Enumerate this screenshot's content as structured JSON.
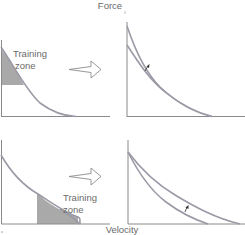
{
  "diagram": {
    "y_axis_label": "Force",
    "x_axis_label": "Velocity",
    "panels": [
      {
        "id": "top-left",
        "description": "Force-velocity curve with training zone at high force / low velocity",
        "zone_label_line1": "Training",
        "zone_label_line2": "zone",
        "zone_position": "high-force"
      },
      {
        "id": "top-right",
        "description": "Curve shifted upward at high-force end after heavy-load training",
        "shift_marker": "up-arrow"
      },
      {
        "id": "bottom-left",
        "description": "Force-velocity curve with training zone at low force / high velocity",
        "zone_label_line1": "Training",
        "zone_label_line2": "zone",
        "zone_position": "high-velocity"
      },
      {
        "id": "bottom-right",
        "description": "Curve shifted outward at high-velocity end after light-load training",
        "shift_marker": "up-arrow"
      }
    ],
    "transition_arrow": "right-outline-arrow",
    "colors": {
      "zone_fill": "#a9a9a9",
      "curve": "#9a9aa6",
      "axis": "#8a8a8a",
      "text": "#6a6a6a"
    }
  }
}
